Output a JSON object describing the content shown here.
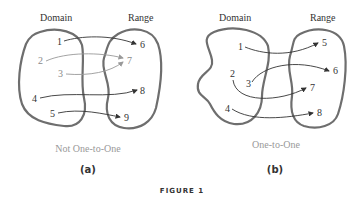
{
  "figure": {
    "label": "FIGURE 1",
    "panels": [
      {
        "id": "a",
        "sublabel": "(a)",
        "caption": "Not One-to-One",
        "domain_label": "Domain",
        "range_label": "Range",
        "domain": [
          "1",
          "2",
          "3",
          "4",
          "5"
        ],
        "range": [
          "6",
          "7",
          "8",
          "9"
        ],
        "mappings": [
          [
            "1",
            "6"
          ],
          [
            "2",
            "7"
          ],
          [
            "3",
            "7"
          ],
          [
            "4",
            "8"
          ],
          [
            "5",
            "9"
          ]
        ]
      },
      {
        "id": "b",
        "sublabel": "(b)",
        "caption": "One-to-One",
        "domain_label": "Domain",
        "range_label": "Range",
        "domain": [
          "1",
          "2",
          "3",
          "4"
        ],
        "range": [
          "5",
          "6",
          "7",
          "8"
        ],
        "mappings": [
          [
            "1",
            "5"
          ],
          [
            "3",
            "6"
          ],
          [
            "2",
            "7"
          ],
          [
            "4",
            "8"
          ]
        ]
      }
    ]
  }
}
